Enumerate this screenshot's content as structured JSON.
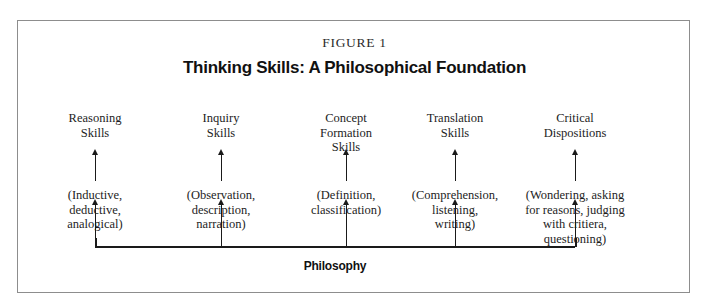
{
  "figure": {
    "label": "FIGURE 1",
    "title": "Thinking Skills: A Philosophical Foundation",
    "foundation_label": "Philosophy",
    "frame_color": "#8d8d8d",
    "ink_color": "#1a1a1a",
    "background_color": "#ffffff"
  },
  "columns": [
    {
      "title": "Reasoning\nSkills",
      "detail": "(Inductive,\ndeductive,\nanalogical)",
      "x": 94
    },
    {
      "title": "Inquiry\nSkills",
      "detail": "(Observation,\ndescription,\nnarration)",
      "x": 220
    },
    {
      "title": "Concept\nFormation\nSkills",
      "detail": "(Definition,\nclassification)",
      "x": 345
    },
    {
      "title": "Translation\nSkills",
      "detail": "(Comprehension,\nlistening,\nwriting)",
      "x": 454
    },
    {
      "title": "Critical\nDispositions",
      "detail": "(Wondering, asking\nfor reasons, judging\nwith critiera,\nquestioning)",
      "x": 574
    }
  ],
  "diagram_data": {
    "type": "diagram",
    "structure": "foundation-with-upward-arrows",
    "description": "Five thinking-skill categories, each fed by an upward arrow from a horizontal bracket labelled Philosophy. Each category has a heading and a parenthetical list of component skills, with a second upward arrow linking the parenthetical detail to its heading.",
    "root": "Philosophy",
    "branches": [
      "Reasoning Skills",
      "Inquiry Skills",
      "Concept Formation Skills",
      "Translation Skills",
      "Critical Dispositions"
    ],
    "arrow_direction": "upward",
    "arrows_per_column": 2
  }
}
